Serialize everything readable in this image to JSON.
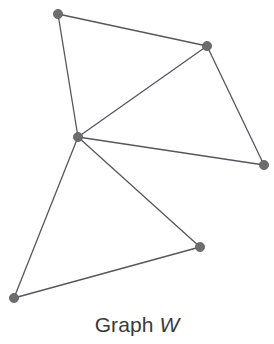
{
  "figure": {
    "caption_prefix": "Graph ",
    "caption_label": "W",
    "background_color": "#ffffff",
    "vertex_color": "#6d6d6d",
    "vertex_stroke_color": "#5f5f5f",
    "edge_color": "#56565e",
    "vertex_radius": 4.6,
    "edge_width": 1.3,
    "caption_color": "#3a3a3a",
    "width": 274,
    "height": 344
  },
  "chart_data": {
    "type": "diagram",
    "title": "Graph W",
    "graph_name": "W",
    "node_count": 6,
    "edge_count": 8,
    "nodes": [
      {
        "id": "A",
        "x": 58,
        "y": 14,
        "degree": 2,
        "position": "top-left"
      },
      {
        "id": "B",
        "x": 207,
        "y": 46,
        "degree": 3,
        "position": "top-right"
      },
      {
        "id": "C",
        "x": 78,
        "y": 137,
        "degree": 5,
        "position": "center-left"
      },
      {
        "id": "D",
        "x": 264,
        "y": 165,
        "degree": 2,
        "position": "right"
      },
      {
        "id": "E",
        "x": 200,
        "y": 247,
        "degree": 2,
        "position": "bottom-right"
      },
      {
        "id": "F",
        "x": 14,
        "y": 298,
        "degree": 2,
        "position": "bottom-left"
      }
    ],
    "edges": [
      {
        "from": "A",
        "to": "B"
      },
      {
        "from": "A",
        "to": "C"
      },
      {
        "from": "B",
        "to": "C"
      },
      {
        "from": "B",
        "to": "D"
      },
      {
        "from": "C",
        "to": "D"
      },
      {
        "from": "C",
        "to": "E"
      },
      {
        "from": "C",
        "to": "F"
      },
      {
        "from": "E",
        "to": "F"
      }
    ],
    "xlabel": "",
    "ylabel": "",
    "grid": false,
    "legend": false
  }
}
